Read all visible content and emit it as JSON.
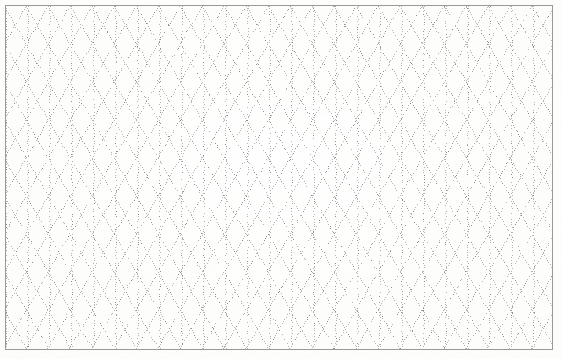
{
  "document": {
    "kind": "isometric-dot-grid-paper",
    "description": "Scanned sheet of isometric (triangular) dotted grid paper with a thin printed rectangular border.",
    "page_width": 562,
    "page_height": 359,
    "text_content": "",
    "labels": [],
    "headings": [],
    "annotations": []
  },
  "paper": {
    "background_color": "#fdfdfb",
    "edge_tone_color": "#f3f3f0",
    "noise_color": "#d8d8d4",
    "noise_opacity": 0.5
  },
  "border": {
    "name": "printed-rectangular-border",
    "color": "#9a9a9a",
    "stroke_width": 1,
    "x": 5,
    "y": 5,
    "width": 548,
    "height": 345
  },
  "grid": {
    "type": "isometric-triangular-dotted",
    "dot_color": "#b4b4b4",
    "dot_color_dark": "#8f8f8f",
    "dot_size": 1,
    "dot_pitch": 2.6,
    "column_spacing": 22,
    "row_height": 19,
    "angles_deg": [
      90,
      30,
      150
    ],
    "origin_x": 5,
    "origin_y": 5,
    "columns": 26,
    "rows": 19,
    "line_families": [
      {
        "name": "vertical",
        "angle_deg": 90
      },
      {
        "name": "diagonal-up-right",
        "angle_deg": 30
      },
      {
        "name": "diagonal-down-right",
        "angle_deg": 150
      }
    ]
  },
  "chart_data": {
    "type": "table",
    "title": "",
    "categories": [],
    "values": [],
    "xlabel": "",
    "ylabel": ""
  }
}
